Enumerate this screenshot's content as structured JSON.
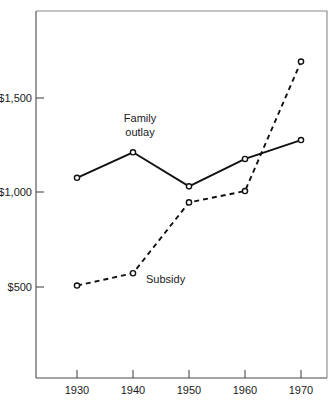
{
  "chart_data": {
    "type": "line",
    "title": "",
    "subtitle": "",
    "xlabel": "",
    "ylabel": "",
    "x": [
      1930,
      1940,
      1950,
      1960,
      1970
    ],
    "categories": [
      "1930",
      "1940",
      "1950",
      "1960",
      "1970"
    ],
    "xtick_labels": [
      "1930",
      "1940",
      "1950",
      "1960",
      "1970"
    ],
    "ytick_labels": [
      "$1,500",
      "$1,000",
      "$500"
    ],
    "ytick_values": [
      1500,
      1000,
      500
    ],
    "xlim": [
      1925,
      1975
    ],
    "ylim": [
      0,
      1800
    ],
    "grid": false,
    "legend": "inline-annotations",
    "series": [
      {
        "name": "Family outlay",
        "style": "solid",
        "marker": "open-circle",
        "values": [
          1075,
          1210,
          1030,
          1175,
          1275
        ]
      },
      {
        "name": "Subsidy",
        "style": "dashed",
        "marker": "open-circle",
        "values": [
          505,
          570,
          945,
          1005,
          1690
        ]
      }
    ],
    "annotations": [
      {
        "text": "Family",
        "series": "Family outlay",
        "x": 1937,
        "y": 1455
      },
      {
        "text": "outlay",
        "series": "Family outlay",
        "x": 1937,
        "y": 1385
      },
      {
        "text": "Subsidy",
        "series": "Subsidy",
        "x": 1948,
        "y": 585
      }
    ],
    "colors": {
      "line": "#111111",
      "marker_fill": "#ffffff",
      "axis": "#4a4a4a",
      "frame": "#8a8a8a",
      "background": "#ffffff",
      "text": "#1a1a1a"
    }
  }
}
